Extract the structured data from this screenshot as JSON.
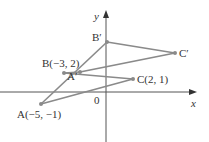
{
  "axes": {
    "x_label": "x",
    "y_label": "y",
    "origin_label": "0"
  },
  "points": {
    "A": {
      "label": "A(−5, −1)",
      "px": [
        41,
        104
      ]
    },
    "B": {
      "label": "B(−3, 2)",
      "px": [
        64,
        73
      ]
    },
    "C": {
      "label": "C(2, 1)",
      "px": [
        133,
        79
      ]
    },
    "A_prime": {
      "label": "A′",
      "px": [
        80,
        72
      ]
    },
    "B_prime": {
      "label": "B′",
      "px": [
        107,
        42
      ]
    },
    "C_prime": {
      "label": "C′",
      "px": [
        175,
        53
      ]
    }
  },
  "colors": {
    "line": "#8a8a8a",
    "axis": "#555555",
    "text": "#333333"
  }
}
